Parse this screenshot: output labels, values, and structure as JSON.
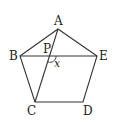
{
  "figure": {
    "type": "regular pentagon with diagonals",
    "vertices": {
      "A": {
        "label": "A",
        "x": 58,
        "y": 29
      },
      "B": {
        "label": "B",
        "x": 20,
        "y": 56
      },
      "C": {
        "label": "C",
        "x": 35,
        "y": 102
      },
      "D": {
        "label": "D",
        "x": 83,
        "y": 102
      },
      "E": {
        "label": "E",
        "x": 97,
        "y": 56
      }
    },
    "intersection": {
      "label": "P",
      "x": 50,
      "y": 56
    },
    "angle": {
      "label": "x",
      "at": "P",
      "between": [
        "PE",
        "PC"
      ]
    },
    "segments": [
      "AB",
      "BC",
      "CD",
      "DE",
      "EA",
      "BE",
      "AC"
    ],
    "stroke_color": "#333333"
  }
}
